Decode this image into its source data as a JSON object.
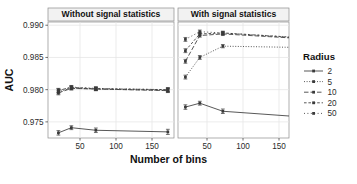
{
  "chart_data": {
    "type": "line",
    "title": "",
    "xlabel": "Number of bins",
    "ylabel": "AUC",
    "ylim": [
      0.9725,
      0.9905
    ],
    "xlim": [
      10,
      195
    ],
    "grid": true,
    "legend_position": "right",
    "legend_title": "Radius",
    "y_ticks": [
      "0.990",
      "0.985",
      "0.980",
      "0.975"
    ],
    "y_tick_values": [
      0.99,
      0.985,
      0.98,
      0.975
    ],
    "x_ticks": [
      "50",
      "100",
      "150"
    ],
    "x_tick_values": [
      50,
      100,
      150
    ],
    "error_bars": true,
    "panels": [
      {
        "label": "Without signal statistics",
        "x": [
          20,
          38,
          72,
          172
        ],
        "series": [
          {
            "name": "2",
            "values": [
              0.9733,
              0.9741,
              0.9737,
              0.97345
            ],
            "err": [
              0.00035,
              0.0003,
              0.00035,
              0.0004
            ]
          },
          {
            "name": "5",
            "values": [
              0.97965,
              0.98025,
              0.9801,
              0.9799
            ],
            "err": [
              0.0003,
              0.00025,
              0.00025,
              0.0003
            ]
          },
          {
            "name": "10",
            "values": [
              0.9795,
              0.9802,
              0.9801,
              0.97985
            ],
            "err": [
              0.0003,
              0.00025,
              0.00025,
              0.0003
            ]
          },
          {
            "name": "20",
            "values": [
              0.9799,
              0.98035,
              0.98015,
              0.98
            ],
            "err": [
              0.0003,
              0.00025,
              0.00025,
              0.0003
            ]
          },
          {
            "name": "50",
            "values": [
              0.97985,
              0.9804,
              0.9802,
              0.98
            ],
            "err": [
              0.0003,
              0.00025,
              0.00025,
              0.0003
            ]
          }
        ]
      },
      {
        "label": "With signal statistics",
        "x": [
          20,
          40,
          72,
          178
        ],
        "series": [
          {
            "name": "2",
            "values": [
              0.9773,
              0.9779,
              0.97665,
              0.9758
            ],
            "err": [
              0.00035,
              0.0003,
              0.00035,
              0.00035
            ]
          },
          {
            "name": "5",
            "values": [
              0.98195,
              0.985,
              0.98675,
              0.98655
            ],
            "err": [
              0.0003,
              0.0003,
              0.00025,
              0.00025
            ]
          },
          {
            "name": "10",
            "values": [
              0.9844,
              0.9884,
              0.98865,
              0.98795
            ],
            "err": [
              0.0003,
              0.00025,
              0.00025,
              0.00025
            ]
          },
          {
            "name": "20",
            "values": [
              0.98605,
              0.98865,
              0.9888,
              0.98805
            ],
            "err": [
              0.0003,
              0.00025,
              0.00025,
              0.00025
            ]
          },
          {
            "name": "50",
            "values": [
              0.9878,
              0.989,
              0.9888,
              0.9881
            ],
            "err": [
              0.0003,
              0.00025,
              0.00025,
              0.00025
            ]
          }
        ]
      }
    ],
    "legend_entries": [
      {
        "label": "2",
        "dash": "none"
      },
      {
        "label": "5",
        "dash": "dotted-fine"
      },
      {
        "label": "10",
        "dash": "dashed-long"
      },
      {
        "label": "20",
        "dash": "dashed-medium"
      },
      {
        "label": "50",
        "dash": "dotted-coarse"
      }
    ],
    "colors": {
      "line": "#3a3a3a",
      "panel_bg": "#ffffff",
      "strip_bg": "#f2f2f2",
      "grid": "#e6e6e6",
      "border": "#8c8c8c",
      "text": "#111111"
    }
  }
}
